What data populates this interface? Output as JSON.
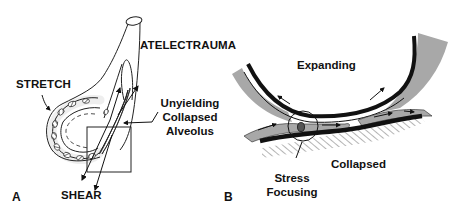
{
  "figure": {
    "panels": [
      {
        "id": "A",
        "letter": "A",
        "labels": {
          "atelectrauma": "ATELECTRAUMA",
          "stretch": "STRETCH",
          "shear": "SHEAR",
          "unyielding_line1": "Unyielding",
          "unyielding_line2": "Collapsed",
          "unyielding_line3": "Alveolus"
        }
      },
      {
        "id": "B",
        "letter": "B",
        "labels": {
          "expanding": "Expanding",
          "collapsed": "Collapsed",
          "stress_line1": "Stress",
          "stress_line2": "Focusing"
        }
      }
    ],
    "colors": {
      "ink": "#111111",
      "gray_fill": "#a8a8a8",
      "light_gray": "#c4c4c4",
      "background": "#ffffff"
    }
  }
}
